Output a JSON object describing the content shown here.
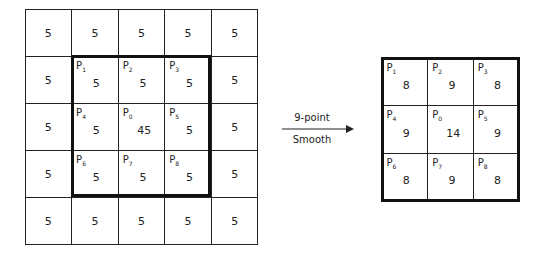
{
  "input_grid": {
    "rows": [
      [
        {
          "v": "5"
        },
        {
          "v": "5"
        },
        {
          "v": "5"
        },
        {
          "v": "5"
        },
        {
          "v": "5"
        }
      ],
      [
        {
          "v": "5"
        },
        {
          "v": "5",
          "p": "1"
        },
        {
          "v": "5",
          "p": "2"
        },
        {
          "v": "5",
          "p": "3"
        },
        {
          "v": "5"
        }
      ],
      [
        {
          "v": "5"
        },
        {
          "v": "5",
          "p": "4"
        },
        {
          "v": "45",
          "p": "0"
        },
        {
          "v": "5",
          "p": "5"
        },
        {
          "v": "5"
        }
      ],
      [
        {
          "v": "5"
        },
        {
          "v": "5",
          "p": "6"
        },
        {
          "v": "5",
          "p": "7"
        },
        {
          "v": "5",
          "p": "8"
        },
        {
          "v": "5"
        }
      ],
      [
        {
          "v": "5"
        },
        {
          "v": "5"
        },
        {
          "v": "5"
        },
        {
          "v": "5"
        },
        {
          "v": "5"
        }
      ]
    ]
  },
  "arrow": {
    "top_label": "9-point",
    "bottom_label": "Smooth"
  },
  "output_grid": {
    "rows": [
      [
        {
          "v": "8",
          "p": "1"
        },
        {
          "v": "9",
          "p": "2"
        },
        {
          "v": "8",
          "p": "3"
        }
      ],
      [
        {
          "v": "9",
          "p": "4"
        },
        {
          "v": "14",
          "p": "0"
        },
        {
          "v": "9",
          "p": "5"
        }
      ],
      [
        {
          "v": "8",
          "p": "6"
        },
        {
          "v": "9",
          "p": "7"
        },
        {
          "v": "8",
          "p": "8"
        }
      ]
    ]
  }
}
